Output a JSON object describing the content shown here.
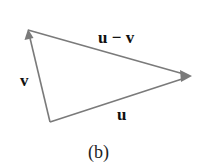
{
  "diagram": {
    "caption": "(b)",
    "labels": {
      "u_minus_v": "u − v",
      "v": "v",
      "u": "u"
    },
    "vectors": [
      {
        "name": "u",
        "from": "bottom-vertex",
        "to": "right-vertex"
      },
      {
        "name": "v",
        "from": "bottom-vertex",
        "to": "top-vertex"
      },
      {
        "name": "u − v",
        "from": "top-vertex",
        "to": "right-vertex"
      }
    ],
    "line_color": "#7a7a7a",
    "text_color": "#111111"
  }
}
